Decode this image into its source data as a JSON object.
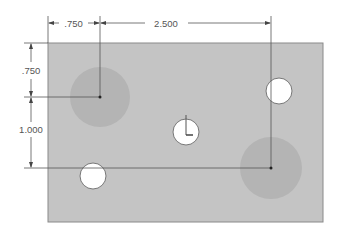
{
  "drawing": {
    "plate": {
      "x": 48,
      "y": 43,
      "width": 275,
      "height": 179,
      "fill": "#c4c4c4",
      "stroke": "#8a8a8a"
    },
    "shaded_circles": [
      {
        "cx": 100,
        "cy": 97,
        "r": 30,
        "fill": "#b2b2b2"
      },
      {
        "cx": 271,
        "cy": 168,
        "r": 31,
        "fill": "#b2b2b2"
      }
    ],
    "holes": [
      {
        "cx": 279,
        "cy": 91,
        "r": 13
      },
      {
        "cx": 186,
        "cy": 132,
        "r": 13
      },
      {
        "cx": 93,
        "cy": 176,
        "r": 13
      }
    ],
    "dimensions": {
      "top_left": {
        "label": ".750"
      },
      "top_right": {
        "label": "2.500"
      },
      "left_top": {
        "label": ".750"
      },
      "left_bottom": {
        "label": "1.000"
      }
    },
    "colors": {
      "line": "#555555",
      "point": "#222222",
      "hole_fill": "#ffffff"
    }
  }
}
